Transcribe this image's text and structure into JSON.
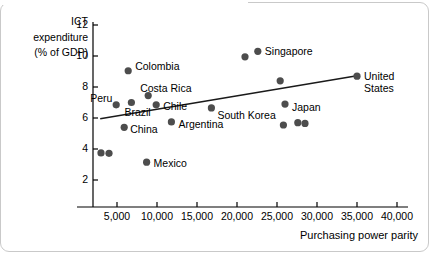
{
  "chart_data": {
    "type": "scatter",
    "title": "",
    "xlabel": "Purchasing power parity",
    "ylabel": "ICT expenditure (% of GDP)",
    "ylabel_lines": [
      "ICT",
      "expenditure",
      "(% of GDP)"
    ],
    "xlim": [
      0,
      42000
    ],
    "ylim": [
      0,
      12.6
    ],
    "xticks": [
      5000,
      10000,
      15000,
      20000,
      25000,
      30000,
      35000,
      40000
    ],
    "xtick_labels": [
      "5,000",
      "10,000",
      "15,000",
      "20,000",
      "25,000",
      "30,000",
      "35,000",
      "40,000"
    ],
    "yticks": [
      2,
      4,
      6,
      8,
      10,
      12
    ],
    "ytick_labels": [
      "2",
      "4",
      "6",
      "8",
      "10",
      "12"
    ],
    "grid": false,
    "legend": "none",
    "marker_color": "#4d4d4d",
    "line_color": "#1a1a1a",
    "points": [
      {
        "label": "",
        "x": 3000,
        "y": 3.75
      },
      {
        "label": "",
        "x": 4000,
        "y": 3.72
      },
      {
        "label": "Peru",
        "x": 4900,
        "y": 6.85
      },
      {
        "label": "Colombia",
        "x": 6400,
        "y": 9.05
      },
      {
        "label": "China",
        "x": 5900,
        "y": 5.4
      },
      {
        "label": "Brazil",
        "x": 6800,
        "y": 7.0
      },
      {
        "label": "Costa Rica",
        "x": 8900,
        "y": 7.45
      },
      {
        "label": "Chile",
        "x": 9900,
        "y": 6.85
      },
      {
        "label": "Mexico",
        "x": 8700,
        "y": 3.15
      },
      {
        "label": "Argentina",
        "x": 11800,
        "y": 5.75
      },
      {
        "label": "South Korea",
        "x": 16800,
        "y": 6.65
      },
      {
        "label": "",
        "x": 21000,
        "y": 9.95
      },
      {
        "label": "Singapore",
        "x": 22600,
        "y": 10.3
      },
      {
        "label": "",
        "x": 25400,
        "y": 8.4
      },
      {
        "label": "Japan",
        "x": 26000,
        "y": 6.9
      },
      {
        "label": "",
        "x": 25800,
        "y": 5.55
      },
      {
        "label": "",
        "x": 27600,
        "y": 5.7
      },
      {
        "label": "",
        "x": 28500,
        "y": 5.65
      },
      {
        "label": "United States",
        "x": 35000,
        "y": 8.7
      }
    ],
    "trendline": {
      "x1": 2900,
      "y1": 5.95,
      "x2": 35000,
      "y2": 8.72
    }
  }
}
